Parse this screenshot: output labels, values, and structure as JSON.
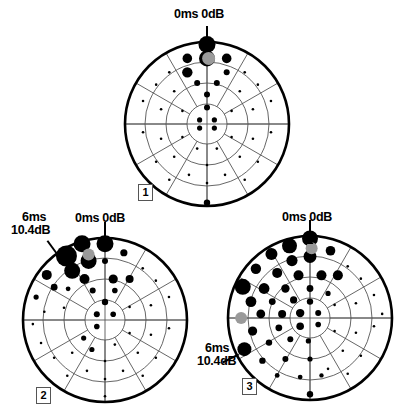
{
  "figure": {
    "type": "visual-field-perimetry-charts",
    "panel_count": 3,
    "background_color": "#ffffff",
    "ink_color": "#000000",
    "grid_color": "#555555",
    "blindspot_color": "#9a9a9a"
  },
  "chart_data": {
    "type": "scatter",
    "title": "",
    "xlabel": "",
    "ylabel": "",
    "panels": [
      {
        "id": "1",
        "number_label": "1",
        "center": [
          207,
          124
        ],
        "radius": 82,
        "rings": [
          20,
          41,
          62,
          82
        ],
        "spokes": 12,
        "annotations": [
          {
            "name": "top-marker",
            "text": "0ms 0dB",
            "lines": [
              "0ms 0dB"
            ],
            "angle_deg": 90,
            "radius": 82
          }
        ],
        "blindspot": {
          "x": 0.02,
          "y": 0.8,
          "r": 6.5
        },
        "points": [
          {
            "x": 0.0,
            "y": 0.97,
            "r": 8.5
          },
          {
            "x": 0.0,
            "y": 0.8,
            "r": 8.0
          },
          {
            "x": -0.24,
            "y": 0.8,
            "r": 4.8
          },
          {
            "x": 0.24,
            "y": 0.8,
            "r": 4.8
          },
          {
            "x": -0.24,
            "y": 0.63,
            "r": 5.2
          },
          {
            "x": 0.24,
            "y": 0.63,
            "r": 3.0
          },
          {
            "x": -0.12,
            "y": 0.5,
            "r": 3.0
          },
          {
            "x": 0.12,
            "y": 0.5,
            "r": 3.0
          },
          {
            "x": 0.0,
            "y": 0.36,
            "r": 3.0
          },
          {
            "x": 0.0,
            "y": 0.2,
            "r": 3.0
          },
          {
            "x": -0.09,
            "y": 0.05,
            "r": 2.6
          },
          {
            "x": 0.09,
            "y": 0.05,
            "r": 2.6
          },
          {
            "x": -0.09,
            "y": -0.05,
            "r": 2.6
          },
          {
            "x": 0.09,
            "y": -0.05,
            "r": 2.6
          },
          {
            "x": 0.0,
            "y": -0.96,
            "r": 3.2
          },
          {
            "x": -0.46,
            "y": 0.63,
            "r": 1.3
          },
          {
            "x": 0.46,
            "y": 0.63,
            "r": 1.3
          },
          {
            "x": -0.62,
            "y": 0.48,
            "r": 1.3
          },
          {
            "x": 0.62,
            "y": 0.48,
            "r": 1.3
          },
          {
            "x": -0.4,
            "y": 0.4,
            "r": 1.3
          },
          {
            "x": 0.4,
            "y": 0.4,
            "r": 1.3
          },
          {
            "x": -0.78,
            "y": 0.28,
            "r": 1.3
          },
          {
            "x": 0.78,
            "y": 0.28,
            "r": 1.3
          },
          {
            "x": -0.56,
            "y": 0.18,
            "r": 1.3
          },
          {
            "x": 0.56,
            "y": 0.18,
            "r": 1.3
          },
          {
            "x": -0.3,
            "y": 0.16,
            "r": 1.3
          },
          {
            "x": 0.3,
            "y": 0.16,
            "r": 1.3
          },
          {
            "x": -0.78,
            "y": -0.1,
            "r": 1.3
          },
          {
            "x": 0.78,
            "y": -0.1,
            "r": 1.3
          },
          {
            "x": -0.56,
            "y": -0.18,
            "r": 1.3
          },
          {
            "x": 0.56,
            "y": -0.18,
            "r": 1.3
          },
          {
            "x": -0.3,
            "y": -0.16,
            "r": 1.3
          },
          {
            "x": 0.3,
            "y": -0.16,
            "r": 1.3
          },
          {
            "x": -0.62,
            "y": -0.46,
            "r": 1.3
          },
          {
            "x": 0.62,
            "y": -0.46,
            "r": 1.3
          },
          {
            "x": -0.4,
            "y": -0.4,
            "r": 1.3
          },
          {
            "x": 0.4,
            "y": -0.4,
            "r": 1.3
          },
          {
            "x": -0.22,
            "y": -0.62,
            "r": 1.3
          },
          {
            "x": 0.22,
            "y": -0.62,
            "r": 1.3
          },
          {
            "x": -0.46,
            "y": -0.68,
            "r": 1.3
          },
          {
            "x": 0.46,
            "y": -0.68,
            "r": 1.3
          },
          {
            "x": 0.0,
            "y": -0.5,
            "r": 1.3
          },
          {
            "x": 0.0,
            "y": -0.72,
            "r": 1.3
          },
          {
            "x": -0.12,
            "y": -0.3,
            "r": 1.3
          },
          {
            "x": 0.12,
            "y": -0.3,
            "r": 1.3
          }
        ]
      },
      {
        "id": "2",
        "number_label": "2",
        "center": [
          105,
          320
        ],
        "radius": 82,
        "rings": [
          20,
          41,
          62,
          82
        ],
        "spokes": 12,
        "annotations": [
          {
            "name": "top-marker",
            "text": "0ms 0dB",
            "lines": [
              "0ms 0dB"
            ],
            "angle_deg": 90,
            "radius": 82
          },
          {
            "name": "left-marker",
            "text": "6ms 10.4dB",
            "lines": [
              "6ms",
              "10.4dB"
            ],
            "angle_deg": 126,
            "radius": 82
          }
        ],
        "blindspot": {
          "x": -0.2,
          "y": 0.8,
          "r": 6.0
        },
        "points": [
          {
            "x": 0.0,
            "y": 0.93,
            "r": 8.5
          },
          {
            "x": -0.28,
            "y": 0.93,
            "r": 8.5
          },
          {
            "x": -0.47,
            "y": 0.78,
            "r": 10.5
          },
          {
            "x": -0.2,
            "y": 0.72,
            "r": 8.0
          },
          {
            "x": -0.4,
            "y": 0.6,
            "r": 8.0
          },
          {
            "x": -0.71,
            "y": 0.55,
            "r": 5.0
          },
          {
            "x": 0.23,
            "y": 0.82,
            "r": 3.6
          },
          {
            "x": 0.0,
            "y": 0.72,
            "r": 3.0
          },
          {
            "x": -0.62,
            "y": 0.4,
            "r": 3.4
          },
          {
            "x": -0.84,
            "y": 0.28,
            "r": 2.6
          },
          {
            "x": -0.25,
            "y": 0.5,
            "r": 5.0
          },
          {
            "x": 0.1,
            "y": 0.5,
            "r": 4.6
          },
          {
            "x": 0.3,
            "y": 0.5,
            "r": 4.0
          },
          {
            "x": -0.45,
            "y": 0.38,
            "r": 2.4
          },
          {
            "x": -0.15,
            "y": 0.36,
            "r": 3.0
          },
          {
            "x": 0.12,
            "y": 0.36,
            "r": 2.8
          },
          {
            "x": 0.0,
            "y": 0.22,
            "r": 3.2
          },
          {
            "x": -0.1,
            "y": 0.07,
            "r": 3.0
          },
          {
            "x": 0.1,
            "y": 0.07,
            "r": 2.8
          },
          {
            "x": -0.1,
            "y": -0.08,
            "r": 2.8
          },
          {
            "x": -0.26,
            "y": -0.22,
            "r": 2.6
          },
          {
            "x": -0.16,
            "y": -0.36,
            "r": 2.6
          },
          {
            "x": 0.46,
            "y": 0.63,
            "r": 1.3
          },
          {
            "x": 0.62,
            "y": 0.48,
            "r": 1.3
          },
          {
            "x": 0.78,
            "y": 0.28,
            "r": 1.3
          },
          {
            "x": 0.56,
            "y": 0.18,
            "r": 1.3
          },
          {
            "x": 0.3,
            "y": 0.16,
            "r": 1.3
          },
          {
            "x": 0.78,
            "y": -0.1,
            "r": 1.3
          },
          {
            "x": 0.56,
            "y": -0.18,
            "r": 1.3
          },
          {
            "x": 0.3,
            "y": -0.16,
            "r": 1.3
          },
          {
            "x": 0.62,
            "y": -0.46,
            "r": 1.3
          },
          {
            "x": 0.4,
            "y": -0.4,
            "r": 1.3
          },
          {
            "x": 0.22,
            "y": -0.62,
            "r": 1.3
          },
          {
            "x": 0.46,
            "y": -0.68,
            "r": 1.3
          },
          {
            "x": -0.88,
            "y": -0.05,
            "r": 1.3
          },
          {
            "x": -0.62,
            "y": -0.46,
            "r": 1.3
          },
          {
            "x": -0.4,
            "y": -0.4,
            "r": 1.3
          },
          {
            "x": -0.22,
            "y": -0.62,
            "r": 1.3
          },
          {
            "x": -0.46,
            "y": -0.68,
            "r": 1.3
          },
          {
            "x": -0.78,
            "y": -0.28,
            "r": 1.3
          },
          {
            "x": 0.0,
            "y": -0.5,
            "r": 1.3
          },
          {
            "x": 0.0,
            "y": -0.72,
            "r": 1.3
          },
          {
            "x": 0.0,
            "y": -0.93,
            "r": 1.3
          },
          {
            "x": 0.12,
            "y": -0.3,
            "r": 1.3
          },
          {
            "x": -0.5,
            "y": 0.15,
            "r": 1.3
          },
          {
            "x": -0.74,
            "y": 0.1,
            "r": 1.3
          }
        ]
      },
      {
        "id": "3",
        "number_label": "3",
        "center": [
          310,
          318
        ],
        "radius": 82,
        "rings": [
          20,
          41,
          62,
          82
        ],
        "spokes": 12,
        "annotations": [
          {
            "name": "top-marker",
            "text": "0ms 0dB",
            "lines": [
              "0ms 0dB"
            ],
            "angle_deg": 90,
            "radius": 82
          },
          {
            "name": "left-marker",
            "text": "6ms 10.4dB",
            "lines": [
              "6ms",
              "10.4dB"
            ],
            "angle_deg": 207,
            "radius": 82
          }
        ],
        "blindspot": {
          "x": 0.02,
          "y": 0.85,
          "r": 6.0
        },
        "blindspot2": {
          "x": -0.84,
          "y": 0.0,
          "r": 6.0
        },
        "points": [
          {
            "x": 0.0,
            "y": 0.97,
            "r": 8.0
          },
          {
            "x": -0.25,
            "y": 0.88,
            "r": 7.5
          },
          {
            "x": 0.0,
            "y": 0.75,
            "r": 6.5
          },
          {
            "x": -0.47,
            "y": 0.78,
            "r": 6.0
          },
          {
            "x": -0.22,
            "y": 0.7,
            "r": 5.6
          },
          {
            "x": 0.25,
            "y": 0.82,
            "r": 4.8
          },
          {
            "x": -0.66,
            "y": 0.6,
            "r": 5.2
          },
          {
            "x": -0.4,
            "y": 0.55,
            "r": 5.0
          },
          {
            "x": -0.14,
            "y": 0.52,
            "r": 5.0
          },
          {
            "x": 0.14,
            "y": 0.52,
            "r": 5.0
          },
          {
            "x": 0.34,
            "y": 0.52,
            "r": 5.0
          },
          {
            "x": -0.82,
            "y": 0.38,
            "r": 8.0
          },
          {
            "x": -0.56,
            "y": 0.36,
            "r": 5.4
          },
          {
            "x": -0.3,
            "y": 0.36,
            "r": 4.2
          },
          {
            "x": 0.0,
            "y": 0.36,
            "r": 3.4
          },
          {
            "x": 0.22,
            "y": 0.3,
            "r": 2.6
          },
          {
            "x": -0.72,
            "y": 0.2,
            "r": 5.4
          },
          {
            "x": -0.46,
            "y": 0.2,
            "r": 3.4
          },
          {
            "x": -0.2,
            "y": 0.22,
            "r": 3.6
          },
          {
            "x": 0.0,
            "y": 0.2,
            "r": 3.2
          },
          {
            "x": -0.6,
            "y": 0.05,
            "r": 4.4
          },
          {
            "x": -0.34,
            "y": 0.05,
            "r": 4.0
          },
          {
            "x": -0.12,
            "y": 0.06,
            "r": 4.2
          },
          {
            "x": 0.1,
            "y": 0.06,
            "r": 3.0
          },
          {
            "x": -0.7,
            "y": -0.16,
            "r": 4.6
          },
          {
            "x": -0.38,
            "y": -0.12,
            "r": 3.4
          },
          {
            "x": -0.12,
            "y": -0.1,
            "r": 3.8
          },
          {
            "x": 0.1,
            "y": -0.08,
            "r": 2.8
          },
          {
            "x": -0.8,
            "y": -0.38,
            "r": 7.0
          },
          {
            "x": -0.5,
            "y": -0.3,
            "r": 3.2
          },
          {
            "x": -0.24,
            "y": -0.26,
            "r": 3.0
          },
          {
            "x": -0.02,
            "y": -0.28,
            "r": 2.6
          },
          {
            "x": -0.58,
            "y": -0.52,
            "r": 3.2
          },
          {
            "x": -0.3,
            "y": -0.5,
            "r": 3.0
          },
          {
            "x": 0.0,
            "y": -0.5,
            "r": 2.6
          },
          {
            "x": -0.4,
            "y": -0.7,
            "r": 2.4
          },
          {
            "x": -0.12,
            "y": -0.72,
            "r": 2.4
          },
          {
            "x": 0.14,
            "y": -0.7,
            "r": 2.2
          },
          {
            "x": 0.0,
            "y": -0.93,
            "r": 3.2
          },
          {
            "x": 0.46,
            "y": 0.63,
            "r": 1.3
          },
          {
            "x": 0.62,
            "y": 0.48,
            "r": 1.3
          },
          {
            "x": 0.78,
            "y": 0.28,
            "r": 1.3
          },
          {
            "x": 0.56,
            "y": 0.18,
            "r": 1.3
          },
          {
            "x": 0.78,
            "y": -0.1,
            "r": 1.3
          },
          {
            "x": 0.56,
            "y": -0.18,
            "r": 1.3
          },
          {
            "x": 0.3,
            "y": -0.16,
            "r": 1.3
          },
          {
            "x": 0.62,
            "y": -0.46,
            "r": 1.3
          },
          {
            "x": 0.4,
            "y": -0.4,
            "r": 1.3
          },
          {
            "x": 0.22,
            "y": -0.62,
            "r": 1.3
          },
          {
            "x": 0.46,
            "y": -0.68,
            "r": 1.3
          },
          {
            "x": 0.88,
            "y": 0.05,
            "r": 1.3
          },
          {
            "x": 0.3,
            "y": 0.16,
            "r": 1.3
          }
        ]
      }
    ]
  },
  "labels": {
    "top_marker": "0ms 0dB",
    "side_marker_line1": "6ms",
    "side_marker_line2": "10.4dB",
    "panel1_number": "1",
    "panel2_number": "2",
    "panel3_number": "3"
  }
}
